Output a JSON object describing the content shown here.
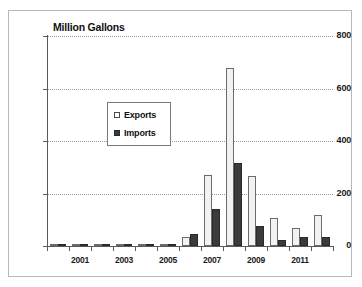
{
  "figure": {
    "title": "Million Gallons",
    "border_color": "#b8b8b8"
  },
  "legend": {
    "position": "inside-upper-left",
    "entries": [
      {
        "label": "Exports",
        "swatch": "exports-swatch-icon",
        "color": "#ffffff"
      },
      {
        "label": "Imports",
        "swatch": "imports-swatch-icon",
        "color": "#3b3b3b"
      }
    ]
  },
  "axes": {
    "y_ticks": [
      "0",
      "200",
      "400",
      "600",
      "800"
    ],
    "y_tick_values": [
      0,
      200,
      400,
      600,
      800
    ],
    "x_ticks": [
      "2001",
      "2003",
      "2005",
      "2007",
      "2009",
      "2011"
    ]
  },
  "chart_data": {
    "type": "bar",
    "title": "Million Gallons",
    "xlabel": "",
    "ylabel": "Million Gallons",
    "ylim": [
      0,
      800
    ],
    "grid": true,
    "legend_position": "inside-upper-left",
    "categories": [
      "2000",
      "2001",
      "2002",
      "2003",
      "2004",
      "2005",
      "2006",
      "2007",
      "2008",
      "2009",
      "2010",
      "2011",
      "2012"
    ],
    "tick_categories": [
      "2001",
      "2003",
      "2005",
      "2007",
      "2009",
      "2011"
    ],
    "series": [
      {
        "name": "Exports",
        "color": "#f2f2f2",
        "values": [
          2,
          3,
          3,
          2,
          2,
          4,
          33,
          270,
          680,
          265,
          105,
          70,
          120
        ]
      },
      {
        "name": "Imports",
        "color": "#3b3b3b",
        "values": [
          1,
          7,
          2,
          2,
          4,
          9,
          45,
          140,
          315,
          75,
          22,
          35,
          33
        ]
      }
    ]
  }
}
